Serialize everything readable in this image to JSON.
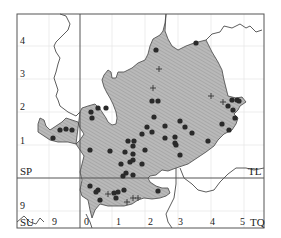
{
  "map": {
    "grid_squares": {
      "top_left": "SP",
      "top_right": "TL",
      "bottom_left": "SU",
      "bottom_right": "TQ"
    },
    "y_axis_labels": [
      "4",
      "3",
      "2",
      "1",
      "9"
    ],
    "x_axis_labels": [
      "9",
      "0",
      "1",
      "2",
      "3",
      "4",
      "5"
    ],
    "colors": {
      "county_fill": "#b5b5b5",
      "hatch": "#9a9a9a",
      "dot": "#2a2a2a",
      "frame": "#555555",
      "gridline": "#e6e6e6"
    },
    "legend": {
      "dot": "record (solid circle)",
      "plus": "record (cross)"
    },
    "records_dots": [
      [
        156,
        50
      ],
      [
        196,
        43
      ],
      [
        152,
        101
      ],
      [
        158,
        101
      ],
      [
        154,
        117
      ],
      [
        165,
        126
      ],
      [
        152,
        132
      ],
      [
        165,
        138
      ],
      [
        232,
        100
      ],
      [
        237,
        100
      ],
      [
        228,
        106
      ],
      [
        233,
        110
      ],
      [
        239,
        101
      ],
      [
        235,
        118
      ],
      [
        91,
        112
      ],
      [
        98,
        108
      ],
      [
        106,
        108
      ],
      [
        92,
        118
      ],
      [
        180,
        121
      ],
      [
        222,
        124
      ],
      [
        229,
        130
      ],
      [
        185,
        127
      ],
      [
        142,
        134
      ],
      [
        147,
        127
      ],
      [
        175,
        137
      ],
      [
        128,
        141
      ],
      [
        134,
        141
      ],
      [
        125,
        152
      ],
      [
        133,
        146
      ],
      [
        133,
        154
      ],
      [
        145,
        150
      ],
      [
        133,
        160
      ],
      [
        175,
        143
      ],
      [
        180,
        155
      ],
      [
        176,
        145
      ],
      [
        208,
        141
      ],
      [
        192,
        133
      ],
      [
        60,
        130
      ],
      [
        66,
        129
      ],
      [
        72,
        130
      ],
      [
        53,
        138
      ],
      [
        90,
        150
      ],
      [
        110,
        151
      ],
      [
        130,
        162
      ],
      [
        121,
        164
      ],
      [
        142,
        164
      ],
      [
        126,
        173
      ],
      [
        123,
        176
      ],
      [
        133,
        175
      ],
      [
        90,
        186
      ],
      [
        96,
        192
      ],
      [
        114,
        193
      ],
      [
        118,
        192
      ],
      [
        124,
        190
      ],
      [
        116,
        198
      ],
      [
        98,
        190
      ],
      [
        158,
        191
      ],
      [
        100,
        200
      ]
    ],
    "records_plus": [
      [
        159,
        69
      ],
      [
        153,
        88
      ],
      [
        211,
        96
      ],
      [
        108,
        194
      ],
      [
        133,
        198
      ],
      [
        138,
        198
      ],
      [
        127,
        202
      ],
      [
        223,
        102
      ]
    ]
  }
}
